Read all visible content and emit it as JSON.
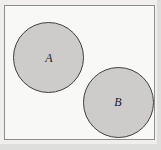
{
  "figure": {
    "kind": "venn-diagram",
    "width": 161,
    "height": 150
  },
  "colors": {
    "page_background": "#e9e9e7",
    "scan_paper": "#f0efee",
    "universe_fill": "#f8f8f7",
    "universe_border": "#8e8e8e",
    "circle_fill": "#cdcccb",
    "circle_border": "#3f3f3f",
    "label_color": "#1d1d1d"
  },
  "universe": {
    "name": "universal-set-rectangle",
    "x": 4,
    "y": 5,
    "width": 151,
    "height": 135
  },
  "sets": [
    {
      "id": "A",
      "label": "A",
      "center_x": 43,
      "center_y": 52,
      "radius": 35,
      "shaded": true
    },
    {
      "id": "B",
      "label": "B",
      "center_x": 113,
      "center_y": 97,
      "radius": 35,
      "shaded": true
    }
  ],
  "relation": {
    "type": "disjoint",
    "overlap": false
  }
}
